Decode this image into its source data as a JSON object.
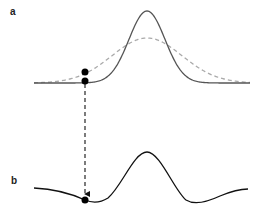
{
  "panels": {
    "a": {
      "label": "a",
      "curves": [
        {
          "name": "solid-gaussian",
          "style": "solid",
          "color": "#555555",
          "center_x": 147,
          "baseline_y": 83,
          "peak_y": 11,
          "sigma": 18
        },
        {
          "name": "dashed-gaussian",
          "style": "dashed",
          "color": "#aaaaaa",
          "center_x": 147,
          "baseline_y": 83,
          "peak_y": 38,
          "sigma": 35
        }
      ],
      "points": [
        {
          "x": 85,
          "y": 72,
          "on": "dashed-gaussian"
        },
        {
          "x": 85,
          "y": 81,
          "on": "solid-gaussian"
        }
      ]
    },
    "b": {
      "label": "b",
      "curve": {
        "name": "difference-curve",
        "style": "solid",
        "color": "#111111"
      },
      "point": {
        "x": 85,
        "y": 200
      }
    },
    "arrow": {
      "x": 85,
      "y_start": 84,
      "y_end": 196,
      "style": "dashed",
      "color": "#111111"
    },
    "colors": {
      "solid_top": "#555555",
      "dashed_top": "#aaaaaa",
      "bottom": "#111111",
      "dot": "#000000"
    }
  }
}
